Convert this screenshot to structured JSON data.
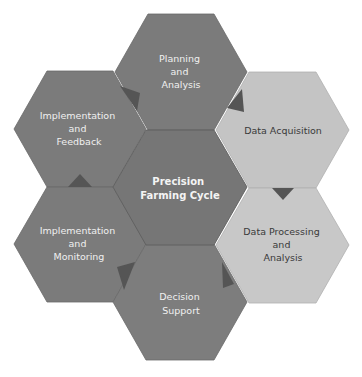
{
  "diagram": {
    "title": "Precision Farming Cycle",
    "colors": {
      "dark_hex": "#7b7b7b",
      "center_hex": "#767676",
      "light_hex": "#c4c4c4",
      "arrow": "#555555",
      "text_on_dark": "#f0f0f0",
      "text_on_light": "#3a3a3a",
      "background": "#ffffff"
    },
    "nodes": [
      {
        "id": "center",
        "lines": [
          "Precision",
          "Farming Cycle"
        ],
        "style": "center"
      },
      {
        "id": "planning",
        "lines": [
          "Planning",
          "and",
          "Analysis"
        ],
        "style": "dark"
      },
      {
        "id": "data-acquisition",
        "lines": [
          "Data Acquisition"
        ],
        "style": "light"
      },
      {
        "id": "data-processing",
        "lines": [
          "Data Processing",
          "and",
          "Analysis"
        ],
        "style": "light"
      },
      {
        "id": "decision-support",
        "lines": [
          "Decision",
          "Support"
        ],
        "style": "dark"
      },
      {
        "id": "impl-monitoring",
        "lines": [
          "Implementation",
          "and",
          "Monitoring"
        ],
        "style": "dark"
      },
      {
        "id": "impl-feedback",
        "lines": [
          "Implementation",
          "and",
          "Feedback"
        ],
        "style": "dark"
      }
    ],
    "cycle_order": [
      "Planning and Analysis",
      "Data Acquisition",
      "Data Processing and Analysis",
      "Decision Support",
      "Implementation and Monitoring",
      "Implementation and Feedback"
    ]
  }
}
